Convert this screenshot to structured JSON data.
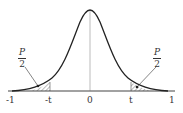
{
  "diagram": {
    "type": "normal-distribution-curve",
    "axis_labels": {
      "neg_one": "-1",
      "neg_t": "-t",
      "zero": "0",
      "t": "t",
      "one": "1"
    },
    "left_annotation": {
      "numerator": "P",
      "denominator": "2"
    },
    "right_annotation": {
      "numerator": "P",
      "denominator": "2"
    },
    "colors": {
      "curve": "#222222",
      "axis": "#444444",
      "hatch": "#555555"
    }
  }
}
